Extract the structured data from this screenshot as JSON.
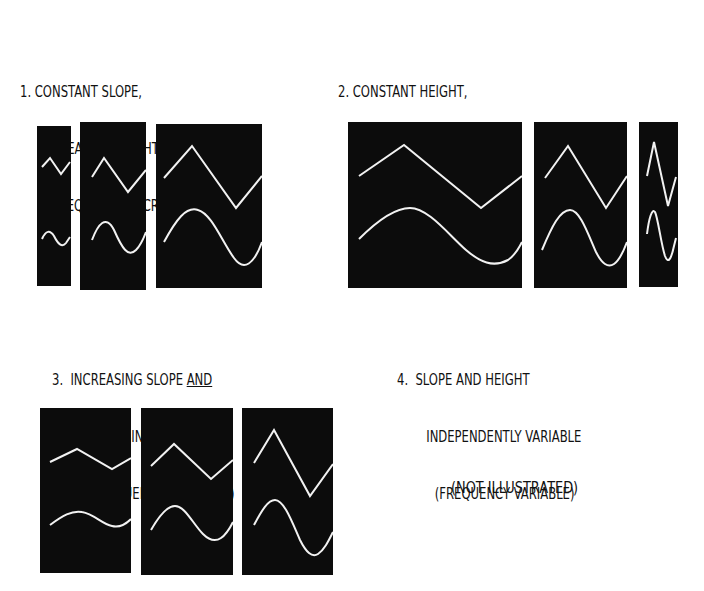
{
  "groups": [
    {
      "number": "1.",
      "line1": "CONSTANT SLOPE,",
      "line2": "INCREASING HEIGHT",
      "line3": "(FREQUENCY DECREASES)",
      "panels": [
        {
          "name": "small",
          "waves": [
            "triangle",
            "sine"
          ]
        },
        {
          "name": "medium",
          "waves": [
            "triangle",
            "sine"
          ]
        },
        {
          "name": "large",
          "waves": [
            "triangle",
            "sine"
          ]
        }
      ]
    },
    {
      "number": "2.",
      "line1": "CONSTANT HEIGHT,",
      "line2": "INCREASING SLOPE",
      "line3": "(FREQUENCY INCREASES)",
      "panels": [
        {
          "name": "wide",
          "waves": [
            "triangle",
            "sine"
          ]
        },
        {
          "name": "medium",
          "waves": [
            "triangle",
            "sine"
          ]
        },
        {
          "name": "narrow",
          "waves": [
            "triangle",
            "sine"
          ]
        }
      ]
    },
    {
      "number": "3.",
      "line1_pre": "INCREASING SLOPE ",
      "line1_underlined": "AND",
      "line2": "INCREASING HEIGHT",
      "line3": "(FREQUENCY CONSTANT)",
      "panels": [
        {
          "name": "low",
          "waves": [
            "triangle",
            "sine"
          ]
        },
        {
          "name": "mid",
          "waves": [
            "triangle",
            "sine"
          ]
        },
        {
          "name": "high",
          "waves": [
            "triangle",
            "sine"
          ]
        }
      ]
    },
    {
      "number": "4.",
      "line1": "SLOPE AND HEIGHT",
      "line2": "INDEPENDENTLY VARIABLE",
      "line3": "(FREQUENCY VARIABLE)",
      "note": "(NOT ILLUSTRATED)"
    }
  ],
  "colors": {
    "panel_bg": "#0c0c0c",
    "trace": "#f2f2f2",
    "page_bg": "#ffffff"
  }
}
